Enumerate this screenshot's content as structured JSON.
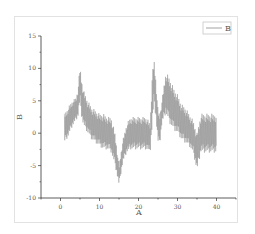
{
  "chart_data": {
    "type": "line",
    "title": "",
    "xlabel": "A",
    "ylabel": "B",
    "xlim": [
      -5,
      45
    ],
    "ylim": [
      -10,
      15
    ],
    "xticks": [
      0,
      10,
      20,
      30,
      40
    ],
    "xtick_labels": [
      "0",
      "10",
      "20",
      "30",
      "40"
    ],
    "yticks": [
      -10,
      -5,
      0,
      5,
      10,
      15
    ],
    "ytick_labels": [
      "-10",
      "-5",
      "0",
      "5",
      "10",
      "15"
    ],
    "grid": false,
    "legend": {
      "position": "top-right",
      "entries": [
        "B"
      ]
    },
    "series": [
      {
        "name": "B",
        "color": "#8c8c8c",
        "style": "dense high-frequency oscillation (envelope shown)",
        "x": [
          1,
          2,
          3,
          4,
          4.5,
          5,
          5.5,
          6,
          7,
          8,
          9,
          10,
          11,
          12,
          13,
          14,
          15,
          16,
          17,
          18,
          19,
          20,
          21,
          22,
          23,
          23.5,
          24,
          24.5,
          25,
          25.5,
          26,
          27,
          28,
          29,
          30,
          31,
          32,
          33,
          34,
          35,
          36,
          37,
          38,
          39,
          40
        ],
        "upper": [
          3,
          4,
          5,
          5.5,
          7,
          10.3,
          8,
          6.5,
          5,
          4,
          3.5,
          3,
          3,
          2.5,
          2.5,
          0,
          -5,
          -1,
          1.5,
          2.5,
          2.5,
          2.5,
          2.5,
          2.5,
          1.5,
          9,
          11.5,
          8,
          3.5,
          3,
          5,
          9.5,
          8.5,
          7,
          6,
          4.5,
          4,
          3,
          2,
          0,
          3,
          3,
          3,
          3,
          3
        ],
        "lower": [
          -1.5,
          -0.5,
          1,
          2,
          2.5,
          5,
          2,
          1,
          0,
          -1,
          -1.5,
          -2,
          -2.5,
          -2.5,
          -3,
          -5,
          -8,
          -4.5,
          -3,
          -2.5,
          -2.5,
          -2.5,
          -2.5,
          -2.5,
          -3,
          1,
          5,
          2,
          -1.5,
          -1.5,
          1.5,
          3,
          1.5,
          0.5,
          0,
          -1,
          -1.5,
          -2,
          -3,
          -5.8,
          -3,
          -3,
          -3,
          -3,
          -3
        ]
      }
    ]
  }
}
